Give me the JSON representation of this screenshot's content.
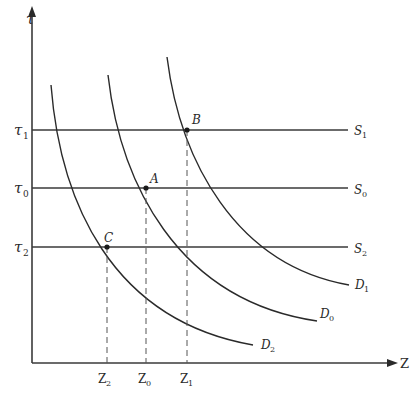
{
  "diagram": {
    "axes": {
      "y_label": "τ",
      "x_label": "Z"
    },
    "y_ticks": [
      {
        "base": "τ",
        "sub": "1",
        "y": 130
      },
      {
        "base": "τ",
        "sub": "0",
        "y": 188
      },
      {
        "base": "τ",
        "sub": "2",
        "y": 247
      }
    ],
    "x_ticks": [
      {
        "base": "Z",
        "sub": "2",
        "x": 107
      },
      {
        "base": "Z",
        "sub": "0",
        "x": 146
      },
      {
        "base": "Z",
        "sub": "1",
        "x": 187
      }
    ],
    "supply_lines": [
      {
        "base": "S",
        "sub": "1"
      },
      {
        "base": "S",
        "sub": "0"
      },
      {
        "base": "S",
        "sub": "2"
      }
    ],
    "demand_curves": [
      {
        "base": "D",
        "sub": "1"
      },
      {
        "base": "D",
        "sub": "0"
      },
      {
        "base": "D",
        "sub": "2"
      }
    ],
    "points": [
      {
        "label": "B",
        "x": 187,
        "y": 130
      },
      {
        "label": "A",
        "x": 146,
        "y": 188
      },
      {
        "label": "C",
        "x": 107,
        "y": 247
      }
    ],
    "colors": {
      "line": "#2a2a2a",
      "dashed": "#555555"
    }
  }
}
